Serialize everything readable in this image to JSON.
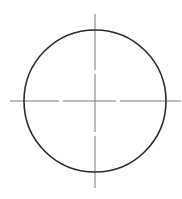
{
  "drawing": {
    "type": "circle-with-centerlines",
    "background": "#ffffff",
    "circle": {
      "cx": 95,
      "cy": 101,
      "r": 71,
      "stroke": "#2a2a2a",
      "stroke_width": 1.6
    },
    "centerlines": {
      "stroke": "#6b6b6b",
      "stroke_width": 0.9,
      "horizontal": {
        "x1": 10,
        "x2": 181,
        "y": 101,
        "gaps": [
          [
            59,
            63
          ],
          [
            116,
            120
          ]
        ]
      },
      "vertical": {
        "x": 95,
        "y1": 14,
        "y2": 188,
        "gaps": [
          [
            70,
            74
          ],
          [
            132,
            136
          ]
        ]
      }
    }
  }
}
